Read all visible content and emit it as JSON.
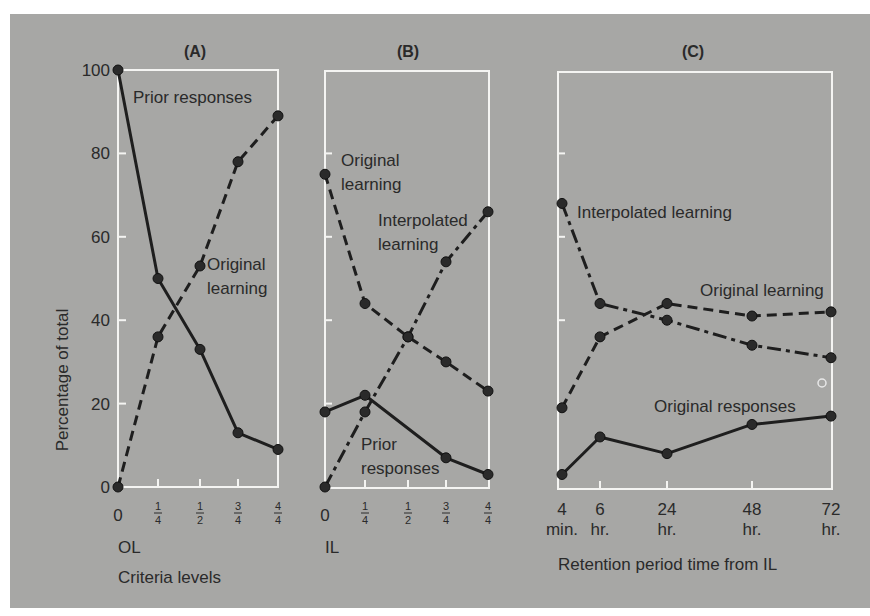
{
  "figure": {
    "background": "#a7a7a5",
    "frame_color": "#f4f4f2",
    "line_color": "#1e1e1e",
    "y_axis_label": "Percentage of total",
    "y_ticks": [
      0,
      20,
      40,
      60,
      80,
      100
    ]
  },
  "chart_data": [
    {
      "type": "line",
      "title": "(A)",
      "xlabel": "Criteria levels",
      "x_axis_sublabel": "OL",
      "ylabel": "Percentage of total",
      "ylim": [
        0,
        100
      ],
      "grid": false,
      "categories": [
        "0",
        "1/4",
        "1/2",
        "3/4",
        "4/4"
      ],
      "series": [
        {
          "name": "Prior responses",
          "style": "solid",
          "values": [
            100,
            50,
            33,
            13,
            9
          ]
        },
        {
          "name": "Original learning",
          "style": "dashed",
          "values": [
            0,
            36,
            53,
            78,
            89
          ]
        }
      ],
      "annotations": [
        {
          "text": "Prior responses",
          "x": 133,
          "y": 103
        },
        {
          "text": "Original learning",
          "lines": [
            "Original",
            "learning"
          ],
          "x": 207,
          "y": 270
        }
      ]
    },
    {
      "type": "line",
      "title": "(B)",
      "xlabel": "",
      "x_axis_sublabel": "IL",
      "ylabel": "Percentage of total",
      "ylim": [
        0,
        100
      ],
      "grid": false,
      "categories": [
        "0",
        "1/4",
        "1/2",
        "3/4",
        "4/4"
      ],
      "series": [
        {
          "name": "Original learning",
          "style": "dashed",
          "values": [
            75,
            44,
            36,
            30,
            23
          ]
        },
        {
          "name": "Interpolated learning",
          "style": "dashdot",
          "values": [
            0,
            18,
            36,
            54,
            66
          ]
        },
        {
          "name": "Prior responses",
          "style": "solid",
          "values": [
            18,
            22,
            null,
            7,
            3
          ]
        }
      ],
      "annotations": [
        {
          "text": "Original learning",
          "lines": [
            "Original",
            "learning"
          ],
          "x": 341,
          "y": 166
        },
        {
          "text": "Interpolated learning",
          "lines": [
            "Interpolated",
            "learning"
          ],
          "x": 378,
          "y": 226
        },
        {
          "text": "Prior responses",
          "lines": [
            "Prior",
            "responses"
          ],
          "x": 361,
          "y": 450
        }
      ]
    },
    {
      "type": "line",
      "title": "(C)",
      "xlabel": "Retention period time from IL",
      "ylabel": "Percentage of total",
      "ylim": [
        0,
        100
      ],
      "grid": false,
      "categories": [
        "4 min.",
        "6 hr.",
        "24 hr.",
        "48 hr.",
        "72 hr."
      ],
      "category_lines": [
        [
          "4",
          "min."
        ],
        [
          "6",
          "hr."
        ],
        [
          "24",
          "hr."
        ],
        [
          "48",
          "hr."
        ],
        [
          "72",
          "hr."
        ]
      ],
      "series": [
        {
          "name": "Interpolated learning",
          "style": "dashdot",
          "values": [
            68,
            44,
            40,
            34,
            31
          ]
        },
        {
          "name": "Original learning",
          "style": "dashed",
          "values": [
            19,
            36,
            44,
            41,
            42
          ]
        },
        {
          "name": "Original responses",
          "style": "solid",
          "values": [
            3,
            12,
            8,
            15,
            17
          ]
        }
      ],
      "annotations": [
        {
          "text": "Interpolated learning",
          "x": 577,
          "y": 218
        },
        {
          "text": "Original learning",
          "x": 700,
          "y": 296
        },
        {
          "text": "Original responses",
          "x": 654,
          "y": 412
        }
      ]
    }
  ]
}
